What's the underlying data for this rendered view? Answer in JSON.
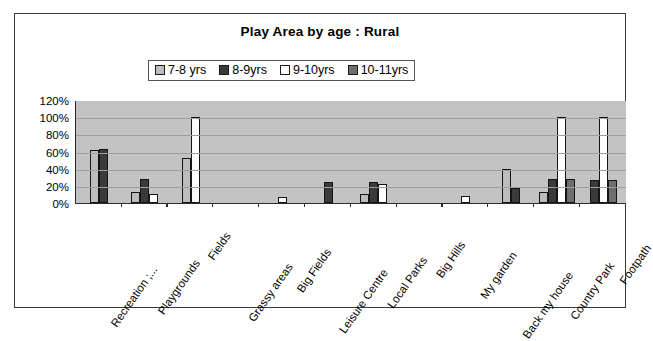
{
  "chart_data": {
    "type": "bar",
    "title": "Play Area by age : Rural",
    "xlabel": "",
    "ylabel": "",
    "ylim": [
      0,
      120
    ],
    "ytick_labels": [
      "120%",
      "100%",
      "80%",
      "60%",
      "40%",
      "20%",
      "0%"
    ],
    "ytick_values": [
      120,
      100,
      80,
      60,
      40,
      20,
      0
    ],
    "grid": true,
    "legend_position": "top-center",
    "categories": [
      "Recreation ;...",
      "Playgrounds",
      "Fields",
      "Grassy areas",
      "Big Fields",
      "Leisure Centre",
      "Local Parks",
      "Big Hills",
      "My garden",
      "Back my house",
      "Country Park",
      "Footpath"
    ],
    "series": [
      {
        "name": "7-8 yrs",
        "color": "#bdbdbd",
        "values": [
          62,
          13,
          52,
          0,
          0,
          0,
          11,
          0,
          0,
          40,
          13,
          0
        ]
      },
      {
        "name": "8-9yrs",
        "color": "#3a3a3a",
        "values": [
          63,
          28,
          0,
          0,
          0,
          25,
          25,
          0,
          0,
          18,
          28,
          27
        ]
      },
      {
        "name": "9-10yrs",
        "color": "#ffffff",
        "values": [
          0,
          10,
          100,
          0,
          7,
          0,
          22,
          0,
          8,
          0,
          100,
          100
        ]
      },
      {
        "name": "10-11yrs",
        "color": "#6e6e6e",
        "values": [
          0,
          0,
          0,
          0,
          0,
          0,
          0,
          0,
          0,
          0,
          28,
          27
        ]
      }
    ],
    "plot_background": "#c3c3c3",
    "frame_color": "#3a3a3a"
  }
}
